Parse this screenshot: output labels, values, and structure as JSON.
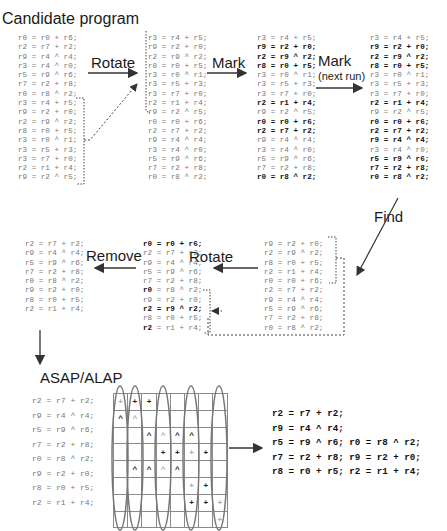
{
  "labels": {
    "title": "Candidate program",
    "rotate1": "Rotate",
    "mark1": "Mark",
    "mark2": "Mark",
    "mark2_sub": "(next run)",
    "find": "Find",
    "rotate2": "Rotate",
    "remove": "Remove",
    "asap_alap": "ASAP/ALAP"
  },
  "columns": {
    "candidate": [
      {
        "t": "r0 = r0 + r6;"
      },
      {
        "t": "r2 = r7 + r2;"
      },
      {
        "t": "r9 = r4 ^ r4;"
      },
      {
        "t": "r3 = r4 ^ r0;"
      },
      {
        "t": "r5 = r9 ^ r6;"
      },
      {
        "t": "r7 = r2 + r8;"
      },
      {
        "t": "r0 = r8 ^ r2;"
      },
      {
        "t": "r3 = r4 + r5;"
      },
      {
        "t": "r9 = r2 + r0;"
      },
      {
        "t": "r2 = r9 ^ r2;"
      },
      {
        "t": "r8 = r0 + r5;"
      },
      {
        "t": "r3 = r0 ^ r1;"
      },
      {
        "t": "r3 = r5 + r3;"
      },
      {
        "t": "r3 = r7 + r0;"
      },
      {
        "t": "r2 = r1 + r4;"
      },
      {
        "t": "r9 = r2 ^ r5;"
      }
    ],
    "rotated": [
      {
        "t": "r3 = r4 + r5;"
      },
      {
        "t": "r9 = r2 + r0;"
      },
      {
        "t": "r2 = r9 ^ r2;"
      },
      {
        "t": "r8 = r0 + r5;"
      },
      {
        "t": "r3 = r0 ^ r1;"
      },
      {
        "t": "r3 = r5 + r3;"
      },
      {
        "t": "r3 = r7 + r0;"
      },
      {
        "t": "r2 = r1 + r4;"
      },
      {
        "t": "r9 = r2 ^ r5;"
      },
      {
        "t": "r0 = r0 + r6;"
      },
      {
        "t": "r2 = r7 + r2;"
      },
      {
        "t": "r9 = r4 ^ r4;"
      },
      {
        "t": "r3 = r4 ^ r0;"
      },
      {
        "t": "r5 = r9 ^ r6;"
      },
      {
        "t": "r7 = r2 + r8;"
      },
      {
        "t": "r0 = r8 ^ r2;"
      }
    ],
    "marked": [
      {
        "t": "r3 = r4 + r5;",
        "b": false
      },
      {
        "t": "r9 = r2 + r0;",
        "b": true
      },
      {
        "t": "r2 = r9 ^ r2;",
        "b": true
      },
      {
        "t": "r8 = r0 + r5;",
        "b": true
      },
      {
        "t": "r3 = r0 ^ r1;",
        "b": false
      },
      {
        "t": "r3 = r5 + r3;",
        "b": false
      },
      {
        "t": "r3 = r7 + r0;",
        "b": false
      },
      {
        "t": "r2 = r1 + r4;",
        "b": true
      },
      {
        "t": "r9 = r2 ^ r5;",
        "b": false
      },
      {
        "t": "r0 = r0 + r6;",
        "b": true
      },
      {
        "t": "r2 = r7 + r2;",
        "b": true
      },
      {
        "t": "r9 = r4 ^ r4;",
        "b": false
      },
      {
        "t": "r3 = r4 ^ r0;",
        "b": false
      },
      {
        "t": "r5 = r9 ^ r6;",
        "b": false
      },
      {
        "t": "r7 = r2 + r8;",
        "b": false
      },
      {
        "t": "r0 = r8 ^ r2;",
        "b": true
      }
    ],
    "marked_next": [
      {
        "t": "r3 = r4 + r5;",
        "b": false
      },
      {
        "t": "r9 = r2 + r0;",
        "b": true
      },
      {
        "t": "r2 = r9 ^ r2;",
        "b": true
      },
      {
        "t": "r8 = r0 + r5;",
        "b": true
      },
      {
        "t": "r3 = r0 ^ r1;",
        "b": false
      },
      {
        "t": "r3 = r5 + r3;",
        "b": false
      },
      {
        "t": "r3 = r7 + r0;",
        "b": false
      },
      {
        "t": "r2 = r1 + r4;",
        "b": true
      },
      {
        "t": "r9 = r2 ^ r5;",
        "b": false
      },
      {
        "t": "r0 = r0 + r6;",
        "b": true
      },
      {
        "t": "r2 = r7 + r2;",
        "b": true
      },
      {
        "t": "r9 = r4 ^ r4;",
        "b": true
      },
      {
        "t": "r3 = r4 ^ r0;",
        "b": false
      },
      {
        "t": "r5 = r9 ^ r6;",
        "b": true
      },
      {
        "t": "r7 = r2 + r8;",
        "b": true
      },
      {
        "t": "r0 = r8 ^ r2;",
        "b": true
      }
    ],
    "found": [
      {
        "t": "r9 = r2 + r0;"
      },
      {
        "t": "r2 = r9 ^ r2;"
      },
      {
        "t": "r8 = r0 + r5;"
      },
      {
        "t": "r2 = r1 + r4;"
      },
      {
        "t": "r0 = r0 + r6;"
      },
      {
        "t": "r2 = r7 + r2;"
      },
      {
        "t": "r9 = r4 ^ r4;"
      },
      {
        "t": "r5 = r9 ^ r6;"
      },
      {
        "t": "r7 = r2 + r8;"
      },
      {
        "t": "r0 = r8 ^ r2;"
      }
    ],
    "rotated2": [
      {
        "t": "r0 = r0 + r6;",
        "b": true
      },
      {
        "t": "r2 = r7 + r2;",
        "b": false
      },
      {
        "t": "r9 = r4 ^ r4;",
        "b": false
      },
      {
        "t": "r5 = r9 ^ r6;",
        "b": false
      },
      {
        "t": "r7 = r2 + r8;",
        "b": false
      },
      {
        "t": "r0",
        "rest": " = r8 ^ r2;",
        "b": "partial"
      },
      {
        "t": "r9 = r2 + r0;",
        "b": false
      },
      {
        "t": "r2 = r9 ^ r2;",
        "b": true
      },
      {
        "t": "r8 = r0 + r5;",
        "b": false
      },
      {
        "t": "r2",
        "rest": " = r1 + r4;",
        "b": "partial"
      }
    ],
    "removed": [
      {
        "t": "r2 = r7 + r2;"
      },
      {
        "t": "r9 = r4 ^ r4;"
      },
      {
        "t": "r5 = r9 ^ r6;"
      },
      {
        "t": "r7 = r2 + r8;"
      },
      {
        "t": "r0 = r8 ^ r2;"
      },
      {
        "t": "r9 = r2 + r0;"
      },
      {
        "t": "r8 = r0 + r5;"
      },
      {
        "t": "r2 = r1 + r4;"
      }
    ],
    "scheduled_input": [
      {
        "t": "r2 = r7 + r2;"
      },
      {
        "t": "r9 = r4 ^ r4;"
      },
      {
        "t": "r5 = r9 ^ r6;"
      },
      {
        "t": "r7 = r2 + r8;"
      },
      {
        "t": "r0 = r8 ^ r2;"
      },
      {
        "t": "r9 = r2 + r0;"
      },
      {
        "t": "r8 = r0 + r5;"
      },
      {
        "t": "r2 = r1 + r4;"
      }
    ],
    "final": [
      {
        "t": "r2 = r7 + r2;"
      },
      {
        "t": "r9 = r4 ^ r4;"
      },
      {
        "t": "r5 = r9 ^ r6; r0 = r8 ^ r2;"
      },
      {
        "t": "r7 = r2 + r8; r9 = r2 + r0;"
      },
      {
        "t": "r8 = r0 + r5; r2 = r1 + r4;"
      }
    ]
  },
  "schedule_grid": {
    "rows": 8,
    "cols": 8,
    "cells": [
      [
        "+L",
        "+",
        "+",
        "",
        "",
        "",
        "",
        ""
      ],
      [
        "^",
        "^L",
        "",
        "",
        "",
        "",
        "",
        ""
      ],
      [
        "",
        "",
        "^",
        "^L",
        "^",
        "^",
        "",
        ""
      ],
      [
        "",
        "",
        "",
        "+",
        "+",
        "+L",
        "+",
        ""
      ],
      [
        "",
        "^",
        "^",
        "^L",
        "^",
        "",
        "",
        ""
      ],
      [
        "",
        "",
        "",
        "",
        "",
        "+L",
        "+",
        ""
      ],
      [
        "",
        "",
        "",
        "",
        "",
        "+",
        "+",
        "+L"
      ],
      [
        "",
        "",
        "",
        "",
        "",
        "",
        "",
        "+L"
      ]
    ],
    "highlighted_columns": [
      0,
      1,
      3,
      5,
      7
    ]
  },
  "colors": {
    "text": "#1a1a1a",
    "code_dim": "#777777",
    "code_bold": "#111111",
    "arrow": "#333333",
    "grid": "#8a8a8a",
    "ellipse": "#777777"
  }
}
